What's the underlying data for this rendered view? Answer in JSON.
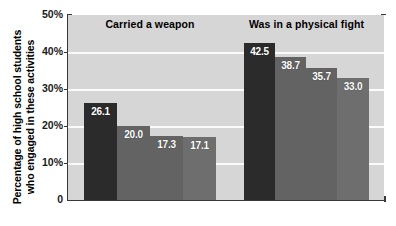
{
  "chart_data": {
    "type": "bar",
    "title": "",
    "xlabel": "",
    "ylabel": "Percentage of high school students who engaged in these activities",
    "ylabel_lines": [
      "Percentage of high school students",
      "who engaged in these activities"
    ],
    "ylim": [
      0,
      50
    ],
    "ytick_labels": [
      "50%",
      "40%",
      "30%",
      "20%",
      "10%",
      "0"
    ],
    "ytick_values": [
      50,
      40,
      30,
      20,
      10,
      0
    ],
    "grid": true,
    "gridline_values": [
      40,
      30,
      20,
      10
    ],
    "legend": "none",
    "groups": [
      {
        "name": "Carried a weapon",
        "values": [
          26.1,
          20.0,
          17.3,
          17.1
        ],
        "value_labels": [
          "26.1",
          "20.0",
          "17.3",
          "17.1"
        ],
        "bar_colors": [
          "#2b2b2b",
          "#636363",
          "#636363",
          "#6e6e6e"
        ]
      },
      {
        "name": "Was in a physical fight",
        "values": [
          42.5,
          38.7,
          35.7,
          33.0
        ],
        "value_labels": [
          "42.5",
          "38.7",
          "35.7",
          "33.0"
        ],
        "bar_colors": [
          "#2b2b2b",
          "#636363",
          "#636363",
          "#6e6e6e"
        ]
      }
    ],
    "plot_background": "#d6d6d6",
    "gridline_color": "#fbfbfb",
    "axis_color": "#3a3a3a",
    "value_label_color": "#ffffff",
    "page_background": "#ffffff"
  }
}
